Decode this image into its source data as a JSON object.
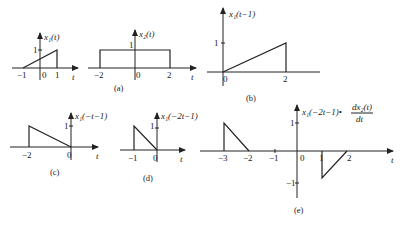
{
  "panels": {
    "a1": {
      "ylabel": "x₁(t)",
      "xvar": "t",
      "ticks_x": [
        "−1",
        "0",
        "1"
      ],
      "tick_y": "1",
      "points": [
        [
          -1,
          0
        ],
        [
          1,
          1
        ],
        [
          1,
          0
        ]
      ]
    },
    "a2": {
      "ylabel": "x₂(t)",
      "xvar": "t",
      "ticks_x": [
        "−2",
        "0",
        "2"
      ],
      "tick_y": "1",
      "points": [
        [
          -2,
          0
        ],
        [
          -2,
          1
        ],
        [
          2,
          1
        ],
        [
          2,
          0
        ]
      ],
      "caption": "(a)"
    },
    "b": {
      "ylabel": "x₁(t−1)",
      "ticks_x": [
        "0",
        "2"
      ],
      "tick_y": "1",
      "points": [
        [
          0,
          0
        ],
        [
          2,
          1
        ],
        [
          2,
          0
        ]
      ],
      "caption": "(b)"
    },
    "c": {
      "ylabel": "x₁(−t−1)",
      "xvar": "t",
      "ticks_x": [
        "−2",
        "0"
      ],
      "tick_y": "1",
      "points": [
        [
          -2,
          0
        ],
        [
          -2,
          1
        ],
        [
          0,
          0
        ]
      ],
      "caption": "(c)"
    },
    "d": {
      "ylabel": "x₁(−2t−1)",
      "xvar": "t",
      "ticks_x": [
        "−1",
        "0"
      ],
      "tick_y": "1",
      "points": [
        [
          -1,
          0
        ],
        [
          -1,
          1
        ],
        [
          0,
          0
        ]
      ],
      "caption": "(d)"
    },
    "e": {
      "ylabel": "x₁(−2t−1)•",
      "ylabel_frac_num": "dx₂(t)",
      "ylabel_frac_den": "dt",
      "xvar": "t",
      "ticks_x": [
        "−3",
        "−2",
        "−1",
        "0",
        "1",
        "2"
      ],
      "tick_y_pos": "1",
      "tick_y_neg": "−1",
      "segments": [
        [
          [
            -3,
            0
          ],
          [
            -3,
            1
          ],
          [
            -2,
            0
          ]
        ],
        [
          [
            1,
            0
          ],
          [
            1,
            -1
          ],
          [
            2,
            0
          ]
        ]
      ],
      "caption": "(e)"
    }
  }
}
